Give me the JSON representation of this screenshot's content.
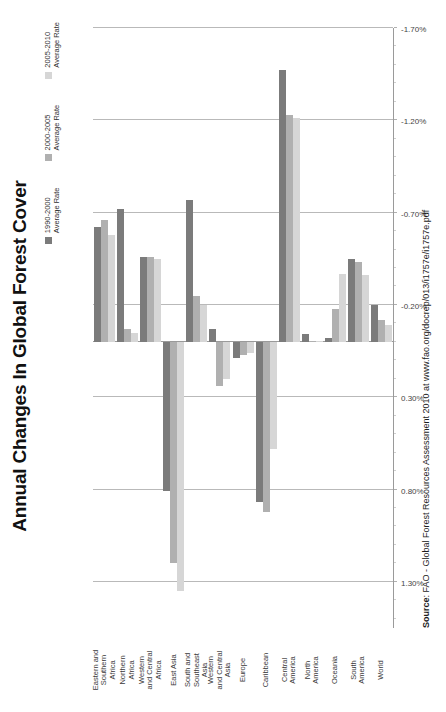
{
  "title": "Annual Changes In Global Forest Cover",
  "source": {
    "label": "Source",
    "text": ": FAO - Global Forest Resources Assessment 2010 at www.fao.org/docrep/013/i1757e/i1757e.pdf"
  },
  "legend": [
    {
      "name": "1990-2000",
      "sub": "Average Rate",
      "color": "#7b7b7b"
    },
    {
      "name": "2000-2005",
      "sub": "Average Rate",
      "color": "#b0b0b0"
    },
    {
      "name": "2005-2010",
      "sub": "Average Rate",
      "color": "#d6d6d6"
    }
  ],
  "axis": {
    "ticks": [
      "1.30%",
      "0.80%",
      "0.30%",
      "-0.20%",
      "-0.70%",
      "-1.20%",
      "-1.70%"
    ],
    "tick_values": [
      1.3,
      0.8,
      0.3,
      -0.2,
      -0.7,
      -1.2,
      -1.7
    ],
    "min": -1.7,
    "max": 1.55,
    "minor_step": 0.1
  },
  "chart_data": {
    "type": "bar",
    "orientation": "horizontal",
    "title": "Annual Changes In Global Forest Cover",
    "xlabel": "",
    "ylabel": "",
    "xlim": [
      -1.7,
      1.55
    ],
    "grid": true,
    "legend_position": "top-right",
    "unit": "percent per year",
    "categories": [
      [
        "Eastern and",
        "Southern",
        "Africa"
      ],
      [
        "Northern",
        "Africa"
      ],
      [
        "Western",
        "and Central",
        "Africa"
      ],
      [
        "East Asia"
      ],
      [
        "South and",
        "Southeast",
        "Asia"
      ],
      [
        "Western",
        "and Central",
        "Asia"
      ],
      [
        "Europe"
      ],
      [
        "Caribbean"
      ],
      [
        "Central",
        "America"
      ],
      [
        "North",
        "America"
      ],
      [
        "Oceania"
      ],
      [
        "South",
        "America"
      ],
      [
        "World"
      ]
    ],
    "category_names": [
      "Eastern and Southern Africa",
      "Northern Africa",
      "Western and Central Africa",
      "East Asia",
      "South and Southeast Asia",
      "Western and Central Asia",
      "Europe",
      "Caribbean",
      "Central America",
      "North America",
      "Oceania",
      "South America",
      "World"
    ],
    "series": [
      {
        "name": "1990-2000 Average Rate",
        "color": "#7b7b7b",
        "values": [
          -0.62,
          -0.72,
          -0.46,
          0.81,
          -0.77,
          -0.07,
          0.09,
          0.87,
          -1.47,
          -0.04,
          -0.02,
          -0.45,
          -0.2
        ]
      },
      {
        "name": "2000-2005 Average Rate",
        "color": "#b0b0b0",
        "values": [
          -0.66,
          -0.07,
          -0.46,
          1.2,
          -0.25,
          0.24,
          0.07,
          0.92,
          -1.23,
          0.0,
          -0.18,
          -0.43,
          -0.12
        ]
      },
      {
        "name": "2005-2010 Average Rate",
        "color": "#d6d6d6",
        "values": [
          -0.58,
          -0.05,
          -0.45,
          1.35,
          -0.2,
          0.2,
          0.06,
          0.58,
          -1.21,
          0.0,
          -0.37,
          -0.36,
          -0.09
        ]
      }
    ]
  }
}
